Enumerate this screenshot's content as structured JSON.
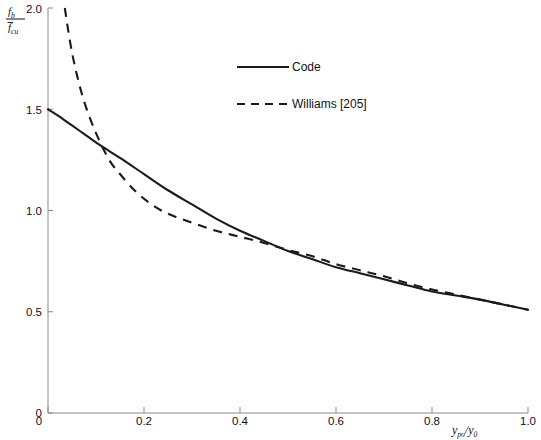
{
  "chart_data": {
    "type": "line",
    "title": "",
    "xlabel": "y_po/y_0",
    "ylabel": "f_b / f̄_cu",
    "xlim": [
      0,
      1.0
    ],
    "ylim": [
      0,
      2.0
    ],
    "grid": false,
    "legend_position": "upper-center",
    "xticks": [
      "0",
      "0.2",
      "0.4",
      "0.6",
      "0.8",
      "1.0"
    ],
    "xtick_values": [
      0,
      0.2,
      0.4,
      0.6,
      0.8,
      1.0
    ],
    "yticks": [
      "0",
      "0.5",
      "1.0",
      "1.5",
      "2.0"
    ],
    "ytick_values": [
      0,
      0.5,
      1.0,
      1.5,
      2.0
    ],
    "series": [
      {
        "name": "Code",
        "style": "solid",
        "color": "#1a1a1a",
        "x": [
          0.0,
          0.02,
          0.05,
          0.08,
          0.11,
          0.15,
          0.2,
          0.25,
          0.3,
          0.35,
          0.4,
          0.45,
          0.5,
          0.55,
          0.6,
          0.65,
          0.7,
          0.75,
          0.8,
          0.85,
          0.9,
          0.95,
          1.0
        ],
        "y": [
          1.5,
          1.47,
          1.42,
          1.37,
          1.32,
          1.26,
          1.18,
          1.1,
          1.03,
          0.96,
          0.9,
          0.85,
          0.8,
          0.76,
          0.72,
          0.69,
          0.66,
          0.63,
          0.6,
          0.58,
          0.56,
          0.535,
          0.51
        ]
      },
      {
        "name": "Williams [205]",
        "style": "dashed",
        "color": "#1a1a1a",
        "x": [
          0.035,
          0.05,
          0.07,
          0.09,
          0.11,
          0.13,
          0.15,
          0.18,
          0.21,
          0.24,
          0.27,
          0.3,
          0.35,
          0.4,
          0.45,
          0.5,
          0.55,
          0.6,
          0.65,
          0.7,
          0.75,
          0.8,
          0.85,
          0.9,
          0.95,
          1.0
        ],
        "y": [
          2.0,
          1.78,
          1.58,
          1.44,
          1.33,
          1.24,
          1.18,
          1.1,
          1.04,
          0.995,
          0.965,
          0.94,
          0.9,
          0.87,
          0.84,
          0.805,
          0.775,
          0.735,
          0.705,
          0.675,
          0.64,
          0.61,
          0.585,
          0.56,
          0.535,
          0.51
        ]
      }
    ],
    "legend": [
      {
        "label": "Code",
        "style": "solid"
      },
      {
        "label": "Williams [205]",
        "style": "dashed"
      }
    ]
  },
  "axis": {
    "y_label_numerator": "f",
    "y_label_numerator_sub": "b",
    "y_label_denominator": "f",
    "y_label_denominator_sub": "cu",
    "x_label_main": "y",
    "x_label_main_sub": "po",
    "x_label_slash": "/",
    "x_label_second": "y",
    "x_label_second_sub": "0"
  },
  "ticks": {
    "x": [
      {
        "label": "0",
        "value": 0
      },
      {
        "label": "0.2",
        "value": 0.2
      },
      {
        "label": "0.4",
        "value": 0.4
      },
      {
        "label": "0.6",
        "value": 0.6
      },
      {
        "label": "0.8",
        "value": 0.8
      },
      {
        "label": "1.0",
        "value": 1.0
      }
    ],
    "y": [
      {
        "label": "0",
        "value": 0
      },
      {
        "label": "0.5",
        "value": 0.5
      },
      {
        "label": "1.0",
        "value": 1.0
      },
      {
        "label": "1.5",
        "value": 1.5
      },
      {
        "label": "2.0",
        "value": 2.0
      }
    ]
  },
  "colors": {
    "curve": "#1a1a1a",
    "axis": "#8a8a8a",
    "text": "#111111",
    "background": "#ffffff"
  }
}
